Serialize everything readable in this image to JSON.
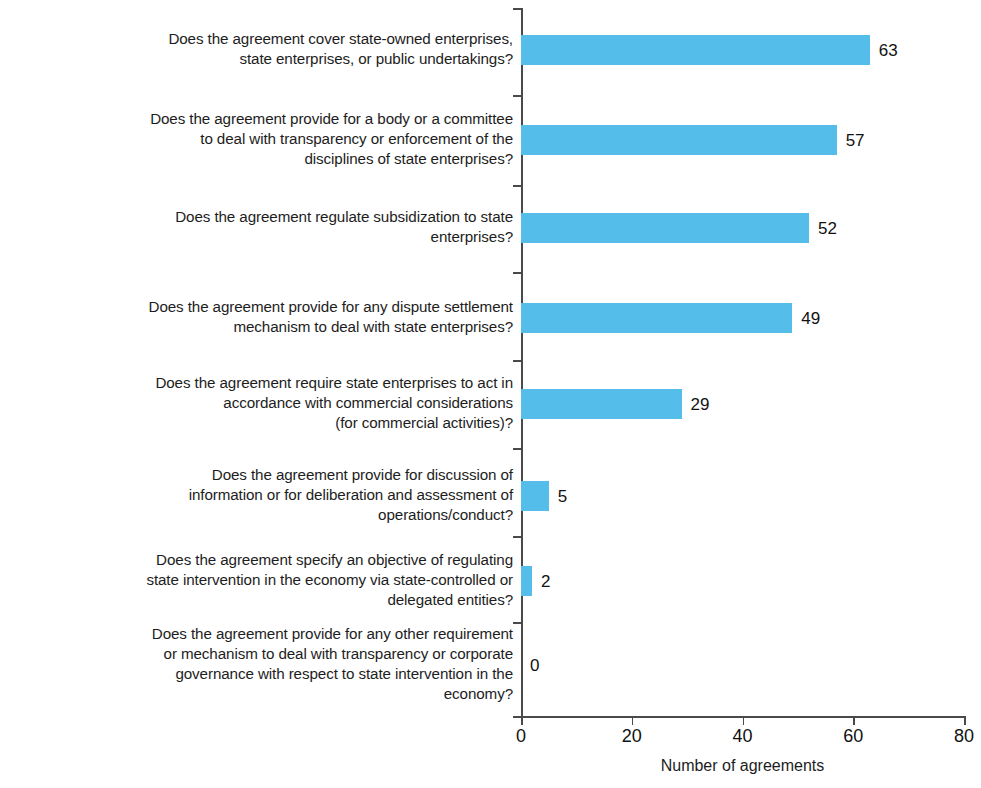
{
  "chart_data": {
    "type": "bar",
    "orientation": "horizontal",
    "title": "",
    "subtitle": "",
    "xlabel": "Number of agreements",
    "ylabel": "",
    "xlim": [
      0,
      80
    ],
    "xticks": [
      0,
      20,
      40,
      60,
      80
    ],
    "grid": false,
    "legend": null,
    "bar_color": "#55bdea",
    "axis_color": "#4a4a4a",
    "text_color": "#1d1d1d",
    "show_value_labels": true,
    "categories": [
      "Does the agreement cover state-owned enterprises,\nstate enterprises, or public undertakings?",
      "Does the agreement provide for a body or a committee\nto deal with transparency or enforcement of the\ndisciplines of state enterprises?",
      "Does the agreement regulate subsidization to state\nenterprises?",
      "Does the agreement provide for any dispute settlement\nmechanism to deal with state enterprises?",
      "Does the agreement require state enterprises to act in\naccordance with commercial considerations\n(for commercial activities)?",
      "Does the agreement provide for discussion of\ninformation or for deliberation and assessment of\noperations/conduct?",
      "Does the agreement specify an objective of regulating\nstate intervention in the economy via state-controlled or\ndelegated entities?",
      "Does the agreement provide for any other requirement\nor mechanism to deal with transparency or corporate\ngovernance with respect to state intervention in the\neconomy?"
    ],
    "values": [
      63,
      57,
      52,
      49,
      29,
      5,
      2,
      0
    ],
    "value_labels": [
      "63",
      "57",
      "52",
      "49",
      "29",
      "5",
      "2",
      "0"
    ],
    "xtick_labels": [
      "0",
      "20",
      "40",
      "60",
      "80"
    ]
  }
}
